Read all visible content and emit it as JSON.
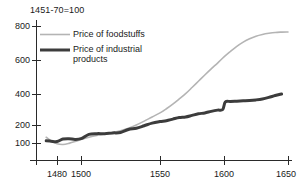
{
  "chart_data": {
    "type": "line",
    "title": "1451-70=100",
    "xlabel": "",
    "ylabel": "",
    "xlim": [
      1471,
      1650
    ],
    "ylim": [
      100,
      800
    ],
    "grid": false,
    "legend_position": "top-left",
    "x_ticks": [
      1480,
      1500,
      1550,
      1600,
      1650
    ],
    "y_ticks": [
      100,
      200,
      400,
      600,
      800
    ],
    "y_axis_note": "compressed below 200",
    "series": [
      {
        "name": "Price of foodstuffs",
        "color": "#b4b4b4",
        "width": 1.6,
        "x": [
          1471,
          1475,
          1480,
          1485,
          1490,
          1495,
          1500,
          1505,
          1510,
          1515,
          1520,
          1525,
          1530,
          1535,
          1540,
          1545,
          1550,
          1555,
          1560,
          1565,
          1570,
          1575,
          1580,
          1585,
          1590,
          1595,
          1600,
          1605,
          1610,
          1615,
          1620,
          1625,
          1630,
          1635,
          1640,
          1645,
          1650
        ],
        "values": [
          132,
          112,
          96,
          92,
          98,
          108,
          120,
          132,
          142,
          150,
          158,
          168,
          182,
          200,
          225,
          252,
          278,
          305,
          335,
          368,
          402,
          438,
          475,
          512,
          548,
          582,
          618,
          650,
          680,
          705,
          725,
          740,
          750,
          757,
          762,
          764,
          765
        ]
      },
      {
        "name": "Price of industrial products",
        "color": "#3c3c3c",
        "width": 3.0,
        "x": [
          1471,
          1475,
          1480,
          1485,
          1490,
          1495,
          1500,
          1505,
          1510,
          1515,
          1520,
          1525,
          1530,
          1535,
          1540,
          1545,
          1550,
          1555,
          1560,
          1565,
          1570,
          1575,
          1580,
          1585,
          1590,
          1595,
          1599,
          1601,
          1605,
          1610,
          1615,
          1620,
          1625,
          1630,
          1635,
          1640,
          1645
        ],
        "values": [
          112,
          110,
          108,
          122,
          124,
          120,
          124,
          148,
          152,
          152,
          156,
          158,
          175,
          182,
          196,
          212,
          222,
          228,
          238,
          248,
          252,
          262,
          272,
          278,
          288,
          296,
          300,
          348,
          352,
          354,
          356,
          358,
          362,
          368,
          378,
          390,
          400
        ]
      }
    ],
    "annotations": []
  },
  "axes": {
    "y_tick_labels": [
      "800",
      "600",
      "400",
      "200",
      "100"
    ],
    "x_tick_labels": [
      "1480",
      "1500",
      "1550",
      "1600",
      "1650"
    ]
  },
  "legend": {
    "items": [
      {
        "label": "Price of foodstuffs"
      },
      {
        "label_line1": "Price of industrial",
        "label_line2": "products"
      }
    ]
  }
}
